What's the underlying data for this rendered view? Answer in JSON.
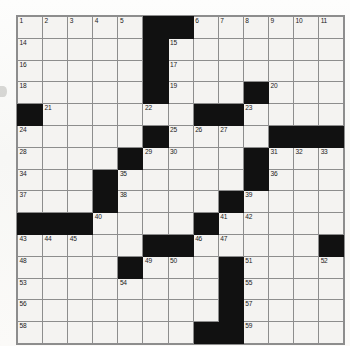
{
  "puzzle": {
    "type": "crossword-grid",
    "columns": 13,
    "rows": 15,
    "cell_background": "#f4f3f1",
    "block_color": "#111111",
    "grid_line_color": "#8d8d8d",
    "number_color": "#1a1a1a",
    "highest_number": 59,
    "grid": [
      [
        {
          "state": "open",
          "number": "1"
        },
        {
          "state": "open",
          "number": "2"
        },
        {
          "state": "open",
          "number": "3"
        },
        {
          "state": "open",
          "number": "4"
        },
        {
          "state": "open",
          "number": "5"
        },
        {
          "state": "block",
          "number": ""
        },
        {
          "state": "block",
          "number": ""
        },
        {
          "state": "open",
          "number": "6"
        },
        {
          "state": "open",
          "number": "7"
        },
        {
          "state": "open",
          "number": "8"
        },
        {
          "state": "open",
          "number": "9"
        },
        {
          "state": "open",
          "number": "10"
        },
        {
          "state": "open",
          "number": "11"
        },
        {
          "state": "open",
          "number": "12"
        },
        {
          "state": "open",
          "number": "13"
        }
      ],
      [
        {
          "state": "open",
          "number": "14"
        },
        {
          "state": "open",
          "number": ""
        },
        {
          "state": "open",
          "number": ""
        },
        {
          "state": "open",
          "number": ""
        },
        {
          "state": "open",
          "number": ""
        },
        {
          "state": "block",
          "number": ""
        },
        {
          "state": "open",
          "number": "15"
        },
        {
          "state": "open",
          "number": ""
        },
        {
          "state": "open",
          "number": ""
        },
        {
          "state": "open",
          "number": ""
        },
        {
          "state": "open",
          "number": ""
        },
        {
          "state": "open",
          "number": ""
        },
        {
          "state": "open",
          "number": ""
        }
      ],
      [
        {
          "state": "open",
          "number": "16"
        },
        {
          "state": "open",
          "number": ""
        },
        {
          "state": "open",
          "number": ""
        },
        {
          "state": "open",
          "number": ""
        },
        {
          "state": "open",
          "number": ""
        },
        {
          "state": "block",
          "number": ""
        },
        {
          "state": "open",
          "number": "17"
        },
        {
          "state": "open",
          "number": ""
        },
        {
          "state": "open",
          "number": ""
        },
        {
          "state": "open",
          "number": ""
        },
        {
          "state": "open",
          "number": ""
        },
        {
          "state": "open",
          "number": ""
        },
        {
          "state": "open",
          "number": ""
        }
      ],
      [
        {
          "state": "open",
          "number": "18"
        },
        {
          "state": "open",
          "number": ""
        },
        {
          "state": "open",
          "number": ""
        },
        {
          "state": "open",
          "number": ""
        },
        {
          "state": "open",
          "number": ""
        },
        {
          "state": "block",
          "number": ""
        },
        {
          "state": "open",
          "number": "19"
        },
        {
          "state": "open",
          "number": ""
        },
        {
          "state": "open",
          "number": ""
        },
        {
          "state": "block",
          "number": ""
        },
        {
          "state": "open",
          "number": "20"
        },
        {
          "state": "open",
          "number": ""
        },
        {
          "state": "open",
          "number": ""
        }
      ],
      [
        {
          "state": "block",
          "number": ""
        },
        {
          "state": "open",
          "number": "21"
        },
        {
          "state": "open",
          "number": ""
        },
        {
          "state": "open",
          "number": ""
        },
        {
          "state": "open",
          "number": ""
        },
        {
          "state": "open",
          "number": "22"
        },
        {
          "state": "open",
          "number": ""
        },
        {
          "state": "block",
          "number": ""
        },
        {
          "state": "block",
          "number": ""
        },
        {
          "state": "open",
          "number": "23"
        },
        {
          "state": "open",
          "number": ""
        },
        {
          "state": "open",
          "number": ""
        },
        {
          "state": "open",
          "number": ""
        }
      ],
      [
        {
          "state": "open",
          "number": "24"
        },
        {
          "state": "open",
          "number": ""
        },
        {
          "state": "open",
          "number": ""
        },
        {
          "state": "open",
          "number": ""
        },
        {
          "state": "open",
          "number": ""
        },
        {
          "state": "block",
          "number": ""
        },
        {
          "state": "open",
          "number": "25"
        },
        {
          "state": "open",
          "number": "26"
        },
        {
          "state": "open",
          "number": "27"
        },
        {
          "state": "open",
          "number": ""
        },
        {
          "state": "block",
          "number": ""
        },
        {
          "state": "block",
          "number": ""
        },
        {
          "state": "block",
          "number": ""
        }
      ],
      [
        {
          "state": "open",
          "number": "28"
        },
        {
          "state": "open",
          "number": ""
        },
        {
          "state": "open",
          "number": ""
        },
        {
          "state": "open",
          "number": ""
        },
        {
          "state": "block",
          "number": ""
        },
        {
          "state": "open",
          "number": "29"
        },
        {
          "state": "open",
          "number": "30"
        },
        {
          "state": "open",
          "number": ""
        },
        {
          "state": "open",
          "number": ""
        },
        {
          "state": "block",
          "number": ""
        },
        {
          "state": "open",
          "number": "31"
        },
        {
          "state": "open",
          "number": "32"
        },
        {
          "state": "open",
          "number": "33"
        }
      ],
      [
        {
          "state": "open",
          "number": "34"
        },
        {
          "state": "open",
          "number": ""
        },
        {
          "state": "open",
          "number": ""
        },
        {
          "state": "block",
          "number": ""
        },
        {
          "state": "open",
          "number": "35"
        },
        {
          "state": "open",
          "number": ""
        },
        {
          "state": "open",
          "number": ""
        },
        {
          "state": "open",
          "number": ""
        },
        {
          "state": "open",
          "number": ""
        },
        {
          "state": "block",
          "number": ""
        },
        {
          "state": "open",
          "number": "36"
        },
        {
          "state": "open",
          "number": ""
        },
        {
          "state": "open",
          "number": ""
        }
      ],
      [
        {
          "state": "open",
          "number": "37"
        },
        {
          "state": "open",
          "number": ""
        },
        {
          "state": "open",
          "number": ""
        },
        {
          "state": "block",
          "number": ""
        },
        {
          "state": "open",
          "number": "38"
        },
        {
          "state": "open",
          "number": ""
        },
        {
          "state": "open",
          "number": ""
        },
        {
          "state": "open",
          "number": ""
        },
        {
          "state": "block",
          "number": ""
        },
        {
          "state": "open",
          "number": "39"
        },
        {
          "state": "open",
          "number": ""
        },
        {
          "state": "open",
          "number": ""
        },
        {
          "state": "open",
          "number": ""
        }
      ],
      [
        {
          "state": "block",
          "number": ""
        },
        {
          "state": "block",
          "number": ""
        },
        {
          "state": "block",
          "number": ""
        },
        {
          "state": "open",
          "number": "40"
        },
        {
          "state": "open",
          "number": ""
        },
        {
          "state": "open",
          "number": ""
        },
        {
          "state": "open",
          "number": ""
        },
        {
          "state": "block",
          "number": ""
        },
        {
          "state": "open",
          "number": "41"
        },
        {
          "state": "open",
          "number": "42"
        },
        {
          "state": "open",
          "number": ""
        },
        {
          "state": "open",
          "number": ""
        },
        {
          "state": "open",
          "number": ""
        }
      ],
      [
        {
          "state": "open",
          "number": "43"
        },
        {
          "state": "open",
          "number": "44"
        },
        {
          "state": "open",
          "number": "45"
        },
        {
          "state": "open",
          "number": ""
        },
        {
          "state": "open",
          "number": ""
        },
        {
          "state": "block",
          "number": ""
        },
        {
          "state": "block",
          "number": ""
        },
        {
          "state": "open",
          "number": "46"
        },
        {
          "state": "open",
          "number": "47"
        },
        {
          "state": "open",
          "number": ""
        },
        {
          "state": "open",
          "number": ""
        },
        {
          "state": "open",
          "number": ""
        },
        {
          "state": "block",
          "number": ""
        }
      ],
      [
        {
          "state": "open",
          "number": "48"
        },
        {
          "state": "open",
          "number": ""
        },
        {
          "state": "open",
          "number": ""
        },
        {
          "state": "open",
          "number": ""
        },
        {
          "state": "block",
          "number": ""
        },
        {
          "state": "open",
          "number": "49"
        },
        {
          "state": "open",
          "number": "50"
        },
        {
          "state": "open",
          "number": ""
        },
        {
          "state": "block",
          "number": ""
        },
        {
          "state": "open",
          "number": "51"
        },
        {
          "state": "open",
          "number": ""
        },
        {
          "state": "open",
          "number": ""
        },
        {
          "state": "open",
          "number": "52"
        }
      ],
      [
        {
          "state": "open",
          "number": "53"
        },
        {
          "state": "open",
          "number": ""
        },
        {
          "state": "open",
          "number": ""
        },
        {
          "state": "open",
          "number": ""
        },
        {
          "state": "open",
          "number": "54"
        },
        {
          "state": "open",
          "number": ""
        },
        {
          "state": "open",
          "number": ""
        },
        {
          "state": "open",
          "number": ""
        },
        {
          "state": "block",
          "number": ""
        },
        {
          "state": "open",
          "number": "55"
        },
        {
          "state": "open",
          "number": ""
        },
        {
          "state": "open",
          "number": ""
        },
        {
          "state": "open",
          "number": ""
        }
      ],
      [
        {
          "state": "open",
          "number": "56"
        },
        {
          "state": "open",
          "number": ""
        },
        {
          "state": "open",
          "number": ""
        },
        {
          "state": "open",
          "number": ""
        },
        {
          "state": "open",
          "number": ""
        },
        {
          "state": "open",
          "number": ""
        },
        {
          "state": "open",
          "number": ""
        },
        {
          "state": "open",
          "number": ""
        },
        {
          "state": "block",
          "number": ""
        },
        {
          "state": "open",
          "number": "57"
        },
        {
          "state": "open",
          "number": ""
        },
        {
          "state": "open",
          "number": ""
        },
        {
          "state": "open",
          "number": ""
        }
      ],
      [
        {
          "state": "open",
          "number": "58"
        },
        {
          "state": "open",
          "number": ""
        },
        {
          "state": "open",
          "number": ""
        },
        {
          "state": "open",
          "number": ""
        },
        {
          "state": "open",
          "number": ""
        },
        {
          "state": "open",
          "number": ""
        },
        {
          "state": "open",
          "number": ""
        },
        {
          "state": "block",
          "number": ""
        },
        {
          "state": "block",
          "number": ""
        },
        {
          "state": "open",
          "number": "59"
        },
        {
          "state": "open",
          "number": ""
        },
        {
          "state": "open",
          "number": ""
        },
        {
          "state": "open",
          "number": ""
        }
      ]
    ]
  }
}
